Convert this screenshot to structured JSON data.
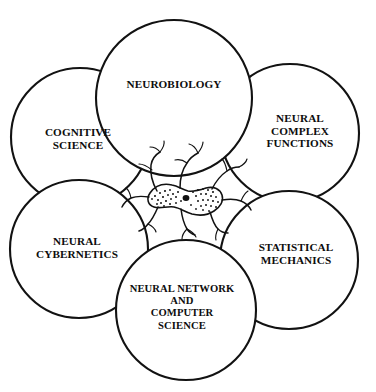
{
  "figure": {
    "background_color": "#ffffff",
    "stroke_color": "#121212",
    "center_icon": "neuron-icon"
  },
  "circles": [
    {
      "id": "neurobiology",
      "label": "NEUROBIOLOGY",
      "position": "top",
      "cx": 174,
      "cy": 98,
      "r": 78,
      "label_x": 174,
      "label_y": 84
    },
    {
      "id": "cognitive-science",
      "label": "COGNITIVE\nSCIENCE",
      "position": "upper-left",
      "cx": 80,
      "cy": 137,
      "r": 69,
      "label_x": 78,
      "label_y": 139
    },
    {
      "id": "neural-complex-functions",
      "label": "NEURAL\nCOMPLEX\nFUNCTIONS",
      "position": "upper-right",
      "cx": 290,
      "cy": 133,
      "r": 69,
      "label_x": 300,
      "label_y": 131
    },
    {
      "id": "neural-cybernetics",
      "label": "NEURAL\nCYBERNETICS",
      "position": "lower-left",
      "cx": 79,
      "cy": 249,
      "r": 69,
      "label_x": 77,
      "label_y": 248
    },
    {
      "id": "statistical-mechanics",
      "label": "STATISTICAL\nMECHANICS",
      "position": "lower-right",
      "cx": 289,
      "cy": 260,
      "r": 69,
      "label_x": 296,
      "label_y": 254
    },
    {
      "id": "neural-network-and-computer-science",
      "label": "NEURAL NETWORK\nAND\nCOMPUTER\nSCIENCE",
      "position": "bottom",
      "cx": 186,
      "cy": 310,
      "r": 70,
      "label_x": 182,
      "label_y": 307
    }
  ],
  "center": {
    "icon": "neuron-icon",
    "description": "Stippled neuron cell body with branching dendrites"
  }
}
